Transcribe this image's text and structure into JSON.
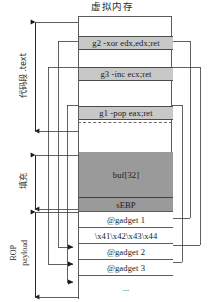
{
  "diagram": {
    "title": "虚拟内存",
    "regions": {
      "code_segment": "代码段 .text",
      "padding": "填充",
      "rop_payload_line1": "ROP",
      "rop_payload_line2": "payload"
    },
    "memory_rows": [
      {
        "id": "top-gap",
        "label": "",
        "kind": "plain"
      },
      {
        "id": "gadget-g2",
        "label": "g2 -xor edx,edx;ret",
        "kind": "gadget"
      },
      {
        "id": "gap-1",
        "label": "",
        "kind": "plain"
      },
      {
        "id": "gadget-g3",
        "label": "g3 -inc ecx;ret",
        "kind": "gadget"
      },
      {
        "id": "gap-2",
        "label": "",
        "kind": "plain"
      },
      {
        "id": "gadget-g1",
        "label": "g1 -pop eax;ret",
        "kind": "gadget"
      },
      {
        "id": "gap-3",
        "label": "",
        "kind": "plain"
      },
      {
        "id": "buf",
        "label": "buf[32]",
        "kind": "buf"
      },
      {
        "id": "sebp",
        "label": "sEBP",
        "kind": "sebp"
      },
      {
        "id": "ret-g1",
        "label": "@gadget 1",
        "kind": "stack"
      },
      {
        "id": "filler",
        "label": "\\x41\\x42\\x43\\x44",
        "kind": "stack"
      },
      {
        "id": "ret-g2",
        "label": "@gadget 2",
        "kind": "stack"
      },
      {
        "id": "ret-g3",
        "label": "@gadget 3",
        "kind": "stack"
      },
      {
        "id": "ellipsis",
        "label": "...",
        "kind": "stack"
      }
    ],
    "colors": {
      "gadget_fill": "#c8c8c8",
      "buffer_fill": "#9a9a9a",
      "stack_fill": "#ffffff",
      "stroke": "#5b5b5b"
    }
  }
}
